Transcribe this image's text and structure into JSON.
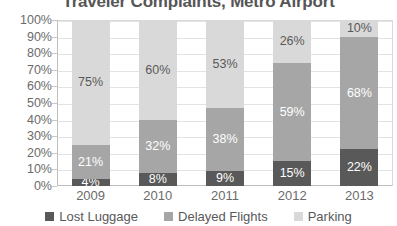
{
  "chart_data": {
    "type": "bar",
    "subtype": "stacked-100-percent",
    "title": "Traveler Complaints, Metro Airport",
    "xlabel": "",
    "ylabel": "",
    "ylim": [
      0,
      100
    ],
    "yticks": [
      "0%",
      "10%",
      "20%",
      "30%",
      "40%",
      "50%",
      "60%",
      "70%",
      "80%",
      "90%",
      "100%"
    ],
    "grid": true,
    "legend_position": "bottom",
    "categories": [
      "2009",
      "2010",
      "2011",
      "2012",
      "2013"
    ],
    "series": [
      {
        "name": "Lost Luggage",
        "color": "#595959",
        "values": [
          4,
          8,
          9,
          15,
          22
        ],
        "labels": [
          "4%",
          "8%",
          "9%",
          "15%",
          "22%"
        ]
      },
      {
        "name": "Delayed Flights",
        "color": "#a6a6a6",
        "values": [
          21,
          32,
          38,
          59,
          68
        ],
        "labels": [
          "21%",
          "32%",
          "38%",
          "59%",
          "68%"
        ]
      },
      {
        "name": "Parking",
        "color": "#d9d9d9",
        "values": [
          75,
          60,
          53,
          26,
          10
        ],
        "labels": [
          "75%",
          "60%",
          "53%",
          "26%",
          "10%"
        ]
      }
    ]
  },
  "legend": {
    "items": [
      {
        "label": "Lost Luggage",
        "color": "#595959"
      },
      {
        "label": "Delayed Flights",
        "color": "#a6a6a6"
      },
      {
        "label": "Parking",
        "color": "#d9d9d9"
      }
    ]
  }
}
